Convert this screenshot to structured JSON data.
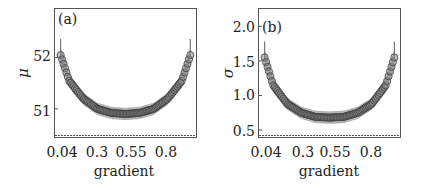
{
  "chart_data": [
    {
      "type": "scatter",
      "panel_label": "(a)",
      "xlabel": "gradient",
      "ylabel": "μ",
      "x_ticks": [
        "0.04",
        "0.3",
        "0.55",
        "0.8"
      ],
      "x_tick_values": [
        0.04,
        0.3,
        0.55,
        0.8
      ],
      "y_ticks": [
        "51",
        "52"
      ],
      "y_tick_values": [
        51,
        52
      ],
      "xlim": [
        0.0,
        1.0
      ],
      "ylim": [
        50.45,
        52.95
      ],
      "series": [
        {
          "name": "mean",
          "marker": "open-circle",
          "band": "±std shaded",
          "x": [
            0.04,
            0.1,
            0.2,
            0.3,
            0.4,
            0.5,
            0.6,
            0.7,
            0.8,
            0.9,
            0.96
          ],
          "values": [
            52.05,
            51.55,
            51.2,
            51.0,
            50.92,
            50.9,
            50.92,
            51.0,
            51.2,
            51.55,
            52.05
          ],
          "band_halfwidth": [
            0.15,
            0.13,
            0.12,
            0.12,
            0.12,
            0.12,
            0.12,
            0.12,
            0.12,
            0.13,
            0.15
          ]
        }
      ],
      "grid": false
    },
    {
      "type": "scatter",
      "panel_label": "(b)",
      "xlabel": "gradient",
      "ylabel": "σ",
      "x_ticks": [
        "0.04",
        "0.3",
        "0.55",
        "0.8"
      ],
      "x_tick_values": [
        0.04,
        0.3,
        0.55,
        0.8
      ],
      "y_ticks": [
        "0.5",
        "1.0",
        "1.5",
        "2.0"
      ],
      "y_tick_values": [
        0.5,
        1.0,
        1.5,
        2.0
      ],
      "xlim": [
        0.0,
        1.0
      ],
      "ylim": [
        0.4,
        2.25
      ],
      "series": [
        {
          "name": "std",
          "marker": "open-circle",
          "band": "±std shaded",
          "x": [
            0.04,
            0.1,
            0.2,
            0.3,
            0.4,
            0.5,
            0.6,
            0.7,
            0.8,
            0.9,
            0.96
          ],
          "values": [
            1.55,
            1.15,
            0.88,
            0.75,
            0.69,
            0.68,
            0.69,
            0.75,
            0.88,
            1.15,
            1.55
          ],
          "band_halfwidth": [
            0.12,
            0.1,
            0.09,
            0.09,
            0.09,
            0.09,
            0.09,
            0.09,
            0.09,
            0.1,
            0.12
          ]
        }
      ],
      "grid": false
    }
  ]
}
